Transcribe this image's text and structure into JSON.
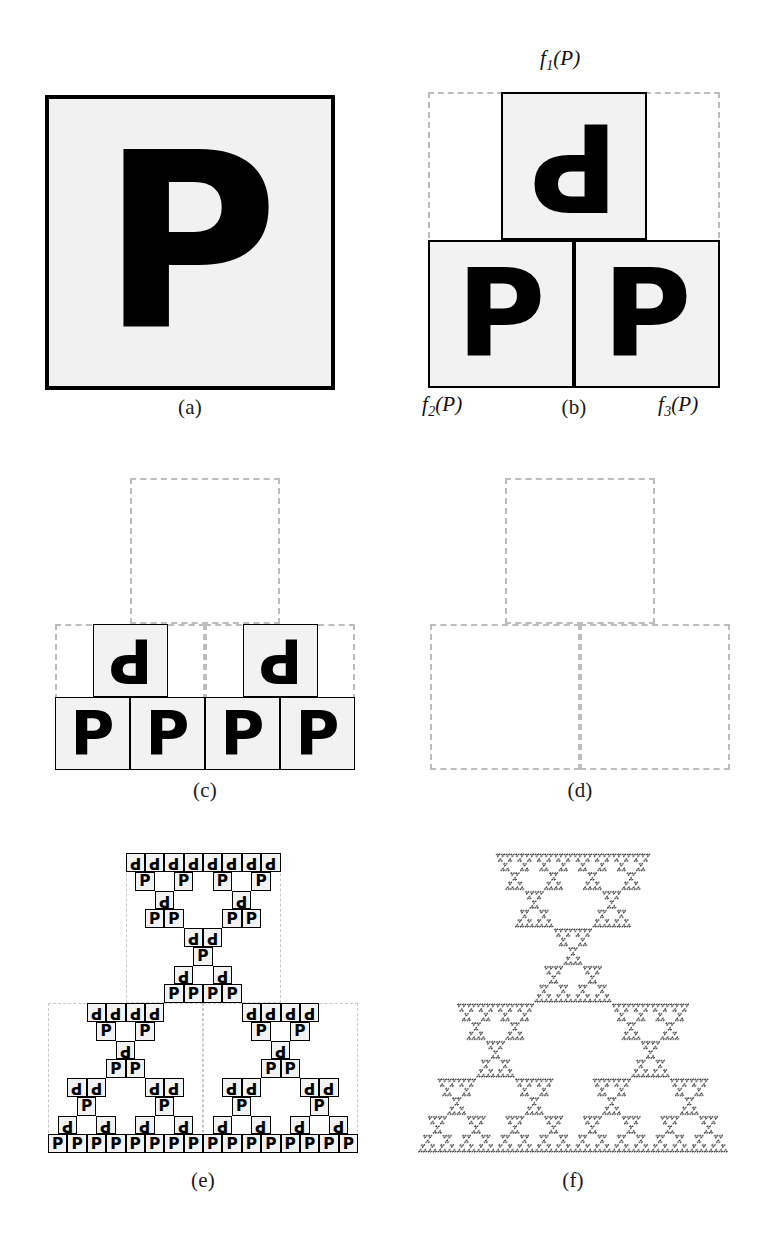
{
  "figure": {
    "letter": "P",
    "background_color": "#ffffff",
    "tile_fill_color": "#f2f2f2",
    "tile_border_color": "#000000",
    "guide_color": "#bdbdbd",
    "attractor_color": "#3a3a3a"
  },
  "labels": {
    "f1": {
      "name": "f",
      "sub": "1",
      "arg": "(P)"
    },
    "f2": {
      "name": "f",
      "sub": "2",
      "arg": "(P)"
    },
    "f3": {
      "name": "f",
      "sub": "3",
      "arg": "(P)"
    }
  },
  "captions": {
    "a": "(a)",
    "b": "(b)",
    "c": "(c)",
    "d": "(d)",
    "e": "(e)",
    "f": "(f)"
  },
  "panels": [
    {
      "id": "a",
      "caption": "(a)",
      "iteration": 0,
      "description": "The seed set P: a single bordered square containing the letter P",
      "tiles": [
        {
          "col": 0,
          "row": 0,
          "glyph": "P",
          "rotated": false
        }
      ]
    },
    {
      "id": "b",
      "caption": "(b)",
      "iteration": 1,
      "description": "First iteration: f1(P) on top rotated 180 degrees, f2(P) bottom-left, f3(P) bottom-right",
      "grid": {
        "cols": 2,
        "rows": 2
      },
      "tiles": [
        {
          "col": 0.5,
          "row": 0,
          "glyph": "P",
          "rotated": true,
          "fn": "f1"
        },
        {
          "col": 0,
          "row": 1,
          "glyph": "P",
          "rotated": false,
          "fn": "f2"
        },
        {
          "col": 1,
          "row": 1,
          "glyph": "P",
          "rotated": false,
          "fn": "f3"
        }
      ]
    },
    {
      "id": "c",
      "caption": "(c)",
      "iteration": 2,
      "description": "Second iteration: four upright P tiles on the base row, two rotated tiles above",
      "grid": {
        "cols": 4,
        "rows": 4
      },
      "tiles": [
        {
          "col": 0.5,
          "row": 2,
          "glyph": "P",
          "rotated": true
        },
        {
          "col": 2.5,
          "row": 2,
          "glyph": "P",
          "rotated": true
        },
        {
          "col": 0,
          "row": 3,
          "glyph": "P",
          "rotated": false
        },
        {
          "col": 1,
          "row": 3,
          "glyph": "P",
          "rotated": false
        },
        {
          "col": 2,
          "row": 3,
          "glyph": "P",
          "rotated": false
        },
        {
          "col": 3,
          "row": 3,
          "glyph": "P",
          "rotated": false
        }
      ]
    },
    {
      "id": "d",
      "caption": "(d)",
      "iteration": 2,
      "description": "The same second-iteration cell structure shown as dashed outlines only, with no tiles",
      "grid": {
        "cols": 2,
        "rows": 2
      },
      "tiles": []
    },
    {
      "id": "e",
      "caption": "(e)",
      "iteration": 4,
      "description": "Fourth iteration: many small P and rotated-P tiles forming a Sierpinski gasket",
      "grid": {
        "cols": 16,
        "rows": 16
      }
    },
    {
      "id": "f",
      "caption": "(f)",
      "iteration": 7,
      "description": "The attractor: deep iteration approximating the Sierpinski triangle",
      "grid": {
        "cols": 128,
        "rows": 128
      }
    }
  ],
  "ifs": {
    "maps": [
      {
        "name": "f1",
        "scale": 0.5,
        "rotation_degrees": 180,
        "translate": [
          0.25,
          0.0
        ]
      },
      {
        "name": "f2",
        "scale": 0.5,
        "rotation_degrees": 0,
        "translate": [
          0.0,
          0.5
        ]
      },
      {
        "name": "f3",
        "scale": 0.5,
        "rotation_degrees": 0,
        "translate": [
          0.5,
          0.5
        ]
      }
    ]
  },
  "geometry": {
    "panel_a": {
      "x": 45,
      "y": 95,
      "w": 290,
      "h": 295
    },
    "panel_b": {
      "x": 428,
      "y": 92,
      "w": 292,
      "h": 296
    },
    "panel_c": {
      "x": 55,
      "y": 478,
      "w": 300,
      "h": 292
    },
    "panel_d": {
      "x": 430,
      "y": 478,
      "w": 300,
      "h": 292
    },
    "panel_e": {
      "x": 48,
      "y": 853,
      "w": 310,
      "h": 300
    },
    "panel_f": {
      "x": 418,
      "y": 853,
      "w": 310,
      "h": 300
    },
    "caption_row_1_y": 395,
    "caption_row_2_y": 778,
    "caption_row_3_y": 1168
  }
}
